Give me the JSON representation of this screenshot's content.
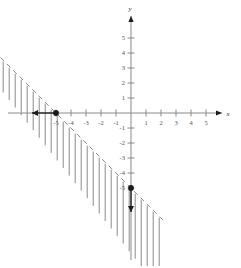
{
  "figure": {
    "type": "coordinate-plane-graph",
    "background_color": "#ffffff",
    "axis_color": "#8a8a8a",
    "boundary_color": "#8f8f8f",
    "hatch_color": "#7d7d7d",
    "marker_color": "#1a1a1a"
  },
  "axes": {
    "x_label": "x",
    "y_label": "y",
    "x_ticks": [
      "-5",
      "-4",
      "-3",
      "-2",
      "-1",
      "1",
      "2",
      "3",
      "4",
      "5"
    ],
    "y_ticks": [
      "5",
      "4",
      "3",
      "2",
      "1",
      "-1",
      "-2",
      "-3",
      "-4",
      "-5"
    ],
    "x_range": [
      -8.7,
      7.3
    ],
    "y_range": [
      -10.2,
      7.5
    ],
    "origin_px": [
      131,
      113
    ],
    "unit_px": 15
  },
  "chart_data": {
    "type": "line",
    "title": "",
    "xlabel": "x",
    "ylabel": "y",
    "xlim": [
      -8.7,
      7.3
    ],
    "ylim": [
      -10.2,
      7.5
    ],
    "grid": false,
    "legend": "none",
    "boundary_line": {
      "style": "dashed",
      "slope": -1,
      "intercept": -5,
      "equation": "y = -x - 5",
      "x_intercept": -5,
      "y_intercept": -5,
      "points": [
        [
          -5,
          0
        ],
        [
          0,
          -5
        ]
      ]
    },
    "shaded_region": {
      "relation": "y < -x - 5",
      "side": "below",
      "fill_style": "vertical-hatching"
    },
    "marked_points": [
      {
        "x": -5,
        "y": 0,
        "style": "filled-dot"
      },
      {
        "x": 0,
        "y": -5,
        "style": "filled-dot"
      }
    ],
    "direction_arrows": [
      {
        "from": [
          -5,
          0
        ],
        "to": [
          -6.6,
          0
        ],
        "direction": "left"
      },
      {
        "from": [
          0,
          -5
        ],
        "to": [
          0,
          -6.6
        ],
        "direction": "down"
      }
    ]
  }
}
